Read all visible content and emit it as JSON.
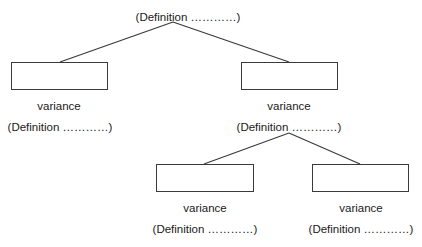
{
  "diagram": {
    "type": "tree",
    "root": {
      "definition": "(Definition …………)"
    },
    "level1": [
      {
        "box_label": "",
        "name": "variance",
        "definition": "(Definition …………)"
      },
      {
        "box_label": "",
        "name": "variance",
        "definition": "(Definition …………)"
      }
    ],
    "level2": [
      {
        "box_label": "",
        "name": "variance",
        "definition": "(Definition …………)"
      },
      {
        "box_label": "",
        "name": "variance",
        "definition": "(Definition …………)"
      }
    ],
    "colors": {
      "line": "#3a3a3a",
      "text": "#1a1a1a",
      "background": "#ffffff"
    }
  }
}
